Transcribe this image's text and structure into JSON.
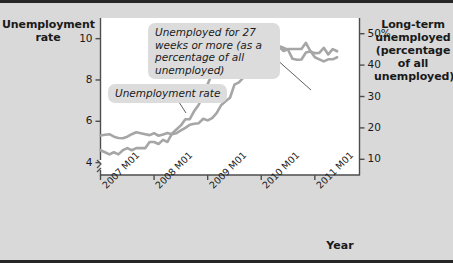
{
  "figure": {
    "background_color": "#d9d9d9",
    "plot_background_color": "#ffffff",
    "border_color": "#262626",
    "series_color": "#a6a6a6",
    "callout_background": "#dcdcdc"
  },
  "titles": {
    "left_axis": "Unemployment rate",
    "right_axis": "Long-term unemployed (percentage of all unemployed)",
    "x_axis": "Year"
  },
  "axes": {
    "left": {
      "ticks": [
        "10",
        "8",
        "6",
        "4"
      ],
      "has_break": true
    },
    "right": {
      "ticks": [
        "50%",
        "40",
        "30",
        "20",
        "10"
      ]
    },
    "x": {
      "ticks": [
        "2007 M01",
        "2008 M01",
        "2009 M01",
        "2010 M01",
        "2011 M01"
      ]
    }
  },
  "callouts": {
    "long_term": "Unemployed for 27 weeks or more (as a percentage of all unemployed)",
    "unemployment_rate": "Unemployment rate"
  },
  "chart_data": {
    "type": "line",
    "title": "",
    "xlabel": "Year",
    "ylabel": "Unemployment rate",
    "y2label": "Long-term unemployed (percentage of all unemployed)",
    "grid": false,
    "legend": "annotations",
    "xlim": [
      "2007 M01",
      "2011 M06"
    ],
    "ylim": [
      3.4,
      11.0
    ],
    "y2lim": [
      5,
      55
    ],
    "x": [
      "2007 M01",
      "2007 M02",
      "2007 M03",
      "2007 M04",
      "2007 M05",
      "2007 M06",
      "2007 M07",
      "2007 M08",
      "2007 M09",
      "2007 M10",
      "2007 M11",
      "2007 M12",
      "2008 M01",
      "2008 M02",
      "2008 M03",
      "2008 M04",
      "2008 M05",
      "2008 M06",
      "2008 M07",
      "2008 M08",
      "2008 M09",
      "2008 M10",
      "2008 M11",
      "2008 M12",
      "2009 M01",
      "2009 M02",
      "2009 M03",
      "2009 M04",
      "2009 M05",
      "2009 M06",
      "2009 M07",
      "2009 M08",
      "2009 M09",
      "2009 M10",
      "2009 M11",
      "2009 M12",
      "2010 M01",
      "2010 M02",
      "2010 M03",
      "2010 M04",
      "2010 M05",
      "2010 M06",
      "2010 M07",
      "2010 M08",
      "2010 M09",
      "2010 M10",
      "2010 M11",
      "2010 M12",
      "2011 M01",
      "2011 M02",
      "2011 M03",
      "2011 M04",
      "2011 M05",
      "2011 M06"
    ],
    "series": [
      {
        "name": "Unemployment rate",
        "axis": "left",
        "unit": "percent",
        "values": [
          4.6,
          4.5,
          4.4,
          4.5,
          4.4,
          4.6,
          4.7,
          4.6,
          4.7,
          4.7,
          4.7,
          5.0,
          5.0,
          4.9,
          5.1,
          5.0,
          5.4,
          5.6,
          5.8,
          6.1,
          6.1,
          6.5,
          6.8,
          7.3,
          7.8,
          8.3,
          8.7,
          9.0,
          9.4,
          9.5,
          9.5,
          9.6,
          9.8,
          10.0,
          9.9,
          9.9,
          9.8,
          9.8,
          9.9,
          9.9,
          9.6,
          9.4,
          9.5,
          9.5,
          9.5,
          9.5,
          9.8,
          9.4,
          9.1,
          9.0,
          8.9,
          9.0,
          9.0,
          9.1
        ]
      },
      {
        "name": "Unemployed for 27 weeks or more (as a percentage of all unemployed)",
        "axis": "right",
        "unit": "percent",
        "values": [
          17.6,
          17.8,
          18.0,
          17.2,
          16.8,
          16.7,
          17.2,
          18.0,
          18.6,
          18.3,
          18.0,
          17.7,
          18.3,
          17.5,
          17.9,
          18.4,
          18.0,
          18.3,
          19.2,
          20.0,
          21.0,
          21.3,
          21.5,
          22.9,
          22.4,
          23.1,
          24.7,
          27.2,
          28.5,
          29.6,
          33.8,
          34.5,
          36.0,
          36.5,
          38.5,
          40.0,
          41.2,
          41.1,
          44.1,
          45.9,
          46.0,
          45.5,
          44.9,
          42.0,
          41.7,
          41.8,
          44.0,
          44.3,
          43.8,
          43.9,
          45.5,
          43.4,
          45.1,
          44.4
        ]
      }
    ]
  }
}
